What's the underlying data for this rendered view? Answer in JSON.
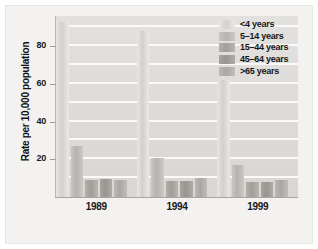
{
  "chart_data": {
    "type": "bar",
    "title": "",
    "subtitle": "",
    "xlabel": "",
    "ylabel": "Rate per 10,000 population",
    "categories": [
      "1989",
      "1994",
      "1999"
    ],
    "series": [
      {
        "name": "<4 years",
        "values": [
          93,
          88,
          62
        ]
      },
      {
        "name": "5–14 years",
        "values": [
          27,
          20.5,
          17
        ]
      },
      {
        "name": "15–44 years",
        "values": [
          9,
          8.5,
          8
        ]
      },
      {
        "name": "45–64 years",
        "values": [
          9.5,
          8.5,
          8
        ]
      },
      {
        "name": ">65 years",
        "values": [
          9,
          10,
          9
        ]
      }
    ],
    "ylim": [
      0,
      96
    ],
    "yticks": [
      20,
      40,
      60,
      80
    ],
    "ytick_labels": [
      "20",
      "40",
      "60",
      "80"
    ],
    "gridlines": true,
    "gridline_values": [
      10,
      20,
      30,
      40,
      50,
      60,
      70,
      80,
      90
    ],
    "legend_position": "top-right",
    "legend_entries": [
      "<4 years",
      "5–14 years",
      "15–44 years",
      "45–64 years",
      ">65 years"
    ],
    "colors": {
      "panel_background": "#dedcd9",
      "gridline": "#fbfaf9",
      "figure_background": "#f3f2f0",
      "series_fills": [
        "#e9e7e5",
        "#c9c6c2",
        "#b3b0ab",
        "#a9a6a1",
        "#bcb9b5"
      ],
      "axis_text": "#161616"
    }
  }
}
